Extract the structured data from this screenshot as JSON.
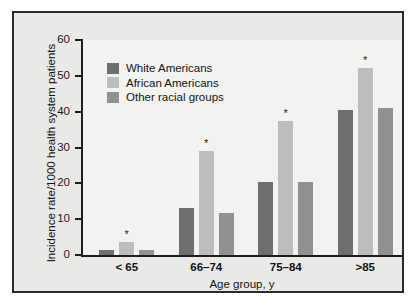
{
  "chart_data": {
    "type": "bar",
    "title": "",
    "xlabel": "Age group, y",
    "ylabel": "Incidence rate/1000 health system patients",
    "categories": [
      "< 65",
      "66–74",
      "75–84",
      ">85"
    ],
    "ylim": [
      0,
      60
    ],
    "yticks": [
      0,
      10,
      20,
      30,
      40,
      50,
      60
    ],
    "ytick_labels": [
      "0",
      "10",
      "20",
      "30",
      "40",
      "50",
      "60"
    ],
    "grid": false,
    "legend_position": "upper-left-inside",
    "series": [
      {
        "name": "White Americans",
        "color": "#6e6e6e",
        "values": [
          1.5,
          13.0,
          20.3,
          40.5
        ],
        "markers": [
          "",
          "",
          "",
          ""
        ]
      },
      {
        "name": "African Americans",
        "color": "#bdbdbd",
        "values": [
          3.5,
          29.0,
          37.5,
          52.2
        ],
        "markers": [
          "*",
          "*",
          "*",
          "*"
        ]
      },
      {
        "name": "Other racial groups",
        "color": "#919191",
        "values": [
          1.5,
          11.8,
          20.3,
          41.0
        ],
        "markers": [
          "",
          "",
          "",
          ""
        ]
      }
    ],
    "annotation_note": "* denotes significance marker shown above African Americans bars"
  },
  "figure": {
    "panel_background": "#e9e9e7",
    "plot_background": "#f2f2f0",
    "frame_color": "#2b2b2b",
    "axis_color": "#1d1d1d"
  }
}
